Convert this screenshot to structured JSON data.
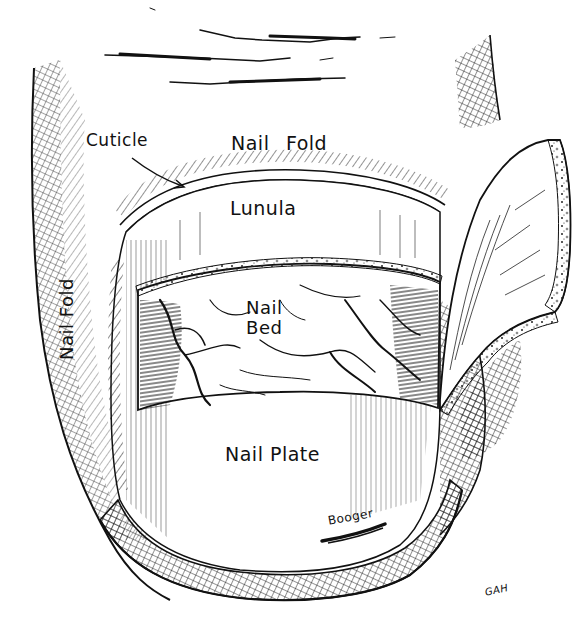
{
  "diagram": {
    "colors": {
      "ink": "#111111",
      "paper": "#ffffff"
    },
    "labels": {
      "cuticle": "Cuticle",
      "nail_fold_top": "Nail Fold",
      "lunula": "Lunula",
      "nail_bed_line1": "Nail",
      "nail_bed_line2": "Bed",
      "nail_fold_side": "Nail Fold",
      "nail_plate": "Nail Plate",
      "booger": "Booger",
      "artist_signature": "GAH"
    },
    "structures": [
      "finger-skin-wrinkles",
      "nail-fold",
      "cuticle",
      "lunula",
      "nail-bed",
      "nail-plate",
      "lifted-nail-flap",
      "free-edge-rim"
    ]
  }
}
